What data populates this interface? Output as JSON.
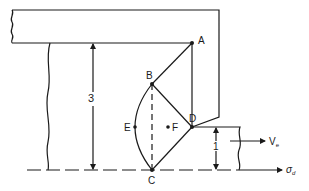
{
  "diagram": {
    "type": "machining-deformation-zone",
    "colors": {
      "stroke": "#1a1a1a",
      "background": "#ffffff"
    },
    "points": {
      "A": {
        "label": "A",
        "x": 192,
        "y": 43
      },
      "B": {
        "label": "B",
        "x": 152,
        "y": 84
      },
      "C": {
        "label": "C",
        "x": 152,
        "y": 170
      },
      "D": {
        "label": "D",
        "x": 192,
        "y": 127
      },
      "E": {
        "label": "E",
        "x": 135,
        "y": 127
      },
      "F": {
        "label": "F",
        "x": 168,
        "y": 127
      }
    },
    "dimensions": {
      "left_height": {
        "label": "3"
      },
      "right_height": {
        "label": "1"
      }
    },
    "arrows": {
      "velocity": {
        "label": "V",
        "subscript": "e"
      },
      "stress": {
        "label": "σ",
        "subscript": "d"
      }
    }
  }
}
